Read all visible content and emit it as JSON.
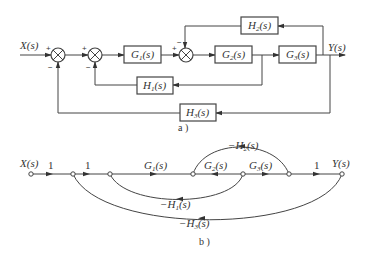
{
  "diagram_a": {
    "caption": "a )",
    "input_label": "X(s)",
    "output_label": "Y(s)",
    "summing_junctions": [
      {
        "id": "sum1",
        "signs": {
          "in": "+",
          "feedback": "−"
        }
      },
      {
        "id": "sum2",
        "signs": {
          "in": "+",
          "feedback": "−"
        }
      },
      {
        "id": "sum3",
        "signs": {
          "in": "+",
          "feedback": "−"
        }
      }
    ],
    "forward_blocks": [
      {
        "name": "G",
        "sub": "1",
        "arg": "(s)"
      },
      {
        "name": "G",
        "sub": "2",
        "arg": "(s)"
      },
      {
        "name": "G",
        "sub": "3",
        "arg": "(s)"
      }
    ],
    "feedback_blocks": [
      {
        "name": "H",
        "sub": "1",
        "arg": "(s)"
      },
      {
        "name": "H",
        "sub": "2",
        "arg": "(s)"
      },
      {
        "name": "H",
        "sub": "3",
        "arg": "(s)"
      }
    ]
  },
  "diagram_b": {
    "caption": "b )",
    "input_label": "X(s)",
    "output_label": "Y(s)",
    "branches": [
      {
        "label": "1"
      },
      {
        "label": "1"
      },
      {
        "name": "G",
        "sub": "1",
        "arg": "(s)"
      },
      {
        "name": "G",
        "sub": "2",
        "arg": "(s)"
      },
      {
        "name": "G",
        "sub": "3",
        "arg": "(s)"
      },
      {
        "label": "1"
      }
    ],
    "feedback_branches": [
      {
        "prefix": "−",
        "name": "H",
        "sub": "1",
        "arg": "(s)"
      },
      {
        "prefix": "−",
        "name": "H",
        "sub": "2",
        "arg": "(s)"
      },
      {
        "prefix": "−",
        "name": "H",
        "sub": "3",
        "arg": "(s)"
      }
    ]
  }
}
